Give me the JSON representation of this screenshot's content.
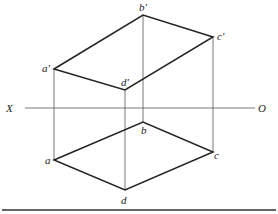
{
  "diagram": {
    "axis": {
      "left_label": "X",
      "right_label": "O"
    },
    "points_top": {
      "a": "a'",
      "b": "b'",
      "c": "c'",
      "d": "d'"
    },
    "points_bottom": {
      "a": "a",
      "b": "b",
      "c": "c",
      "d": "d"
    },
    "colors": {
      "line": "#222222",
      "thin": "#555555"
    }
  }
}
